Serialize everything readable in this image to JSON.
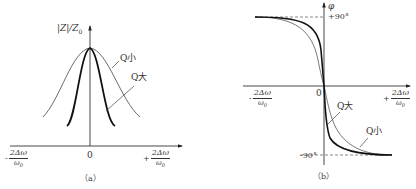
{
  "panel_a": {
    "y_axis_label": "|Z|/Z",
    "y_axis_label_sub": "0",
    "origin_label": "0",
    "x_left_sign": "-",
    "x_right_sign": "+",
    "x_tick_numerator": "2Δω",
    "x_tick_denominator": "ω",
    "x_tick_denominator_sub": "0",
    "curve_labels": {
      "q_small": "Q小",
      "q_large": "Q大"
    },
    "caption": "（a）"
  },
  "panel_b": {
    "y_axis_label": "φ",
    "plus_90_label": "+90°",
    "minus_90_label": "-90°",
    "origin_label": "0",
    "x_left_sign": "-",
    "x_right_sign": "+",
    "x_tick_numerator": "2Δω",
    "x_tick_denominator": "ω",
    "x_tick_denominator_sub": "0",
    "curve_labels": {
      "q_large": "Q大",
      "q_small": "Q小"
    },
    "caption": "（b）"
  }
}
